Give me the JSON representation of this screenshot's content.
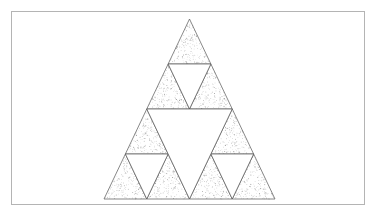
{
  "figure": {
    "type": "geometric-fractal-diagram",
    "iteration_level": 2,
    "canvas": {
      "width": 377,
      "height": 217,
      "background": "#ffffff"
    },
    "frame": {
      "name": "figure-border",
      "x": 11,
      "y": 11,
      "width": 354,
      "height": 194,
      "stroke": "#b4b4b4",
      "stroke_width": 1,
      "fill": "#ffffff"
    },
    "outer_triangle": {
      "apex": {
        "x": 189.5,
        "y": 19
      },
      "bottom_left": {
        "x": 104,
        "y": 199
      },
      "bottom_right": {
        "x": 275,
        "y": 199
      },
      "side_length": 171,
      "height": 180
    },
    "style": {
      "line_stroke": "#555555",
      "line_stroke_width": 0.7,
      "fill_pattern": "stipple",
      "stipple_dot_color": "#787878",
      "stipple_dot_radius": 0.35,
      "stipple_density_per_triangle": 170,
      "hole_fill": "#ffffff"
    },
    "filled_triangle_count": 9,
    "hole_count": 4,
    "holes": [
      {
        "name": "hole-top-center",
        "level": 2
      },
      {
        "name": "hole-bottom-left-center",
        "level": 2
      },
      {
        "name": "hole-bottom-right-center",
        "level": 2
      },
      {
        "name": "hole-center-large",
        "level": 1
      }
    ],
    "sub_triangles": [
      {
        "name": "sub-triangle-top",
        "position": "top"
      },
      {
        "name": "sub-triangle-bottom-left",
        "position": "bottom-left"
      },
      {
        "name": "sub-triangle-bottom-right",
        "position": "bottom-right"
      }
    ]
  },
  "chart_data": {
    "type": "diagram",
    "subtitle": "",
    "iteration": 2,
    "filled_cells": 9,
    "removed_cells": 4,
    "categories": [
      "level-0",
      "level-1",
      "level-2"
    ],
    "values": [
      1,
      3,
      9
    ],
    "xlabel": "",
    "ylabel": "",
    "legend": [],
    "annotations": [],
    "grid": false
  }
}
